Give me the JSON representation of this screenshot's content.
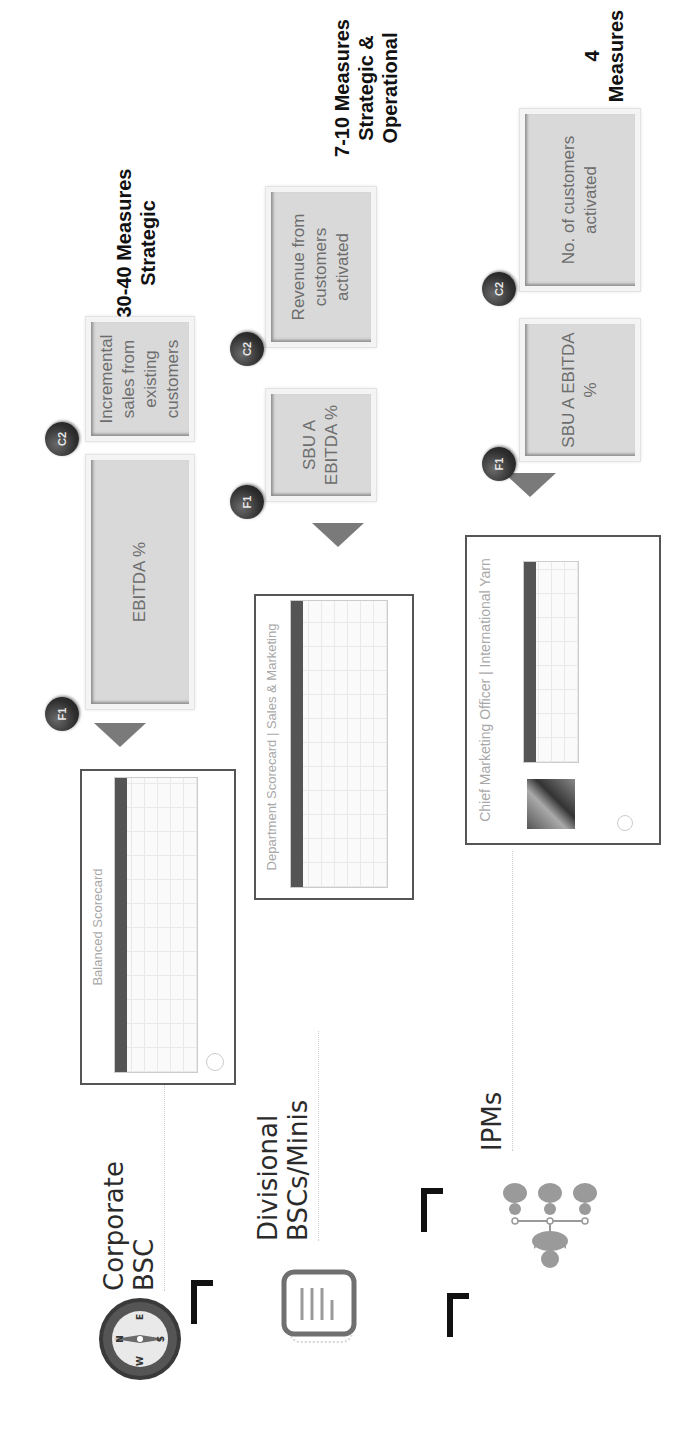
{
  "levels": [
    {
      "id": "corporate",
      "label": "Corporate BSC",
      "label_lines": [
        "Corporate",
        "BSC"
      ],
      "icon": "compass-icon",
      "compass_letters": [
        "N",
        "E",
        "S",
        "W"
      ],
      "thumbnail_title": "Balanced Scorecard",
      "measures_label_lines": [
        "30-40 Measures",
        "Strategic"
      ],
      "kpis": [
        {
          "badge": "F1",
          "text": "EBITDA %"
        },
        {
          "badge": "C2",
          "text": "Incremental sales from existing customers"
        }
      ]
    },
    {
      "id": "divisional",
      "label": "Divisional BSCs/Minis",
      "label_lines": [
        "Divisional",
        "BSCs/Minis"
      ],
      "icon": "document-icon",
      "thumbnail_title": "Department Scorecard | Sales & Marketing",
      "measures_label_lines": [
        "7-10 Measures",
        "Strategic &",
        "Operational"
      ],
      "kpis": [
        {
          "badge": "F1",
          "text": "SBU A EBITDA %"
        },
        {
          "badge": "C2",
          "text": "Revenue from customers activated"
        }
      ]
    },
    {
      "id": "ipms",
      "label": "IPMs",
      "label_lines": [
        "IPMs"
      ],
      "icon": "org-chart-icon",
      "thumbnail_title": "Chief Marketing Officer | International Yarn",
      "measures_label_lines": [
        "4",
        "Measures"
      ],
      "kpis": [
        {
          "badge": "F1",
          "text": "SBU A EBITDA %"
        },
        {
          "badge": "C2",
          "text": "No. of customers activated"
        }
      ]
    }
  ]
}
